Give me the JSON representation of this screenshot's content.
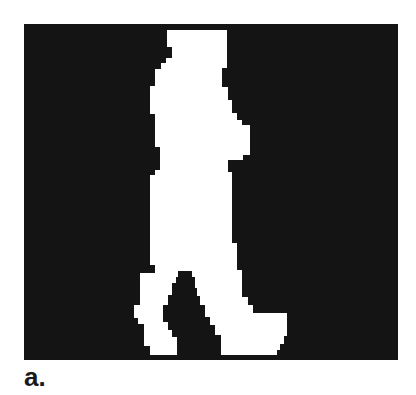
{
  "figure": {
    "label": "a.",
    "colors": {
      "background": "#141414",
      "foreground": "#ffffff"
    }
  }
}
